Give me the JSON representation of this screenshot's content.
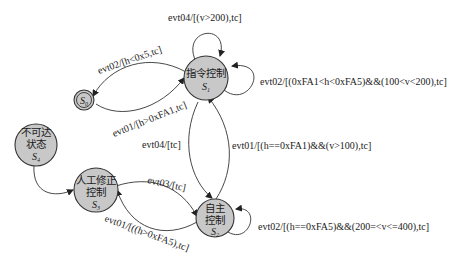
{
  "diagram": {
    "type": "state-machine",
    "nodes": [
      {
        "id": "S0",
        "name": "",
        "symbol": "S",
        "sub": "0",
        "kind": "final"
      },
      {
        "id": "S1",
        "name": "指令控制",
        "symbol": "S",
        "sub": "1"
      },
      {
        "id": "S2",
        "name_line1": "自主",
        "name_line2": "控制",
        "symbol": "S",
        "sub": "2"
      },
      {
        "id": "S3",
        "name_line1": "人工修正",
        "name_line2": "控制",
        "symbol": "S",
        "sub": "3"
      },
      {
        "id": "S4",
        "name_line1": "不可达",
        "name_line2": "状态",
        "symbol": "S",
        "sub": "4"
      }
    ],
    "edges": [
      {
        "from": "S1",
        "to": "S1",
        "label": "evt04/[(v>200),tc]"
      },
      {
        "from": "S1",
        "to": "S1",
        "label": "evt02/[(0xFA1<h<0xFA5)&&(100<v<200),tc]"
      },
      {
        "from": "S1",
        "to": "S0",
        "label": "evt02/[h<0x5,tc]"
      },
      {
        "from": "S0",
        "to": "S1",
        "label": "evt01/[h>0xFA1,tc]"
      },
      {
        "from": "S1",
        "to": "S2",
        "label": "evt04/[tc]"
      },
      {
        "from": "S2",
        "to": "S1",
        "label": "evt01/[(h==0xFA1)&&(v>100),tc]"
      },
      {
        "from": "S2",
        "to": "S2",
        "label": "evt02/[(h==0xFA5)&&(200=<v<=400),tc]"
      },
      {
        "from": "S3",
        "to": "S2",
        "label": "evt03/[tc]"
      },
      {
        "from": "S2",
        "to": "S3",
        "label": "evt01/[((h>0xFA5),tc]"
      },
      {
        "from": "S4",
        "to": "S3",
        "label": ""
      }
    ]
  }
}
